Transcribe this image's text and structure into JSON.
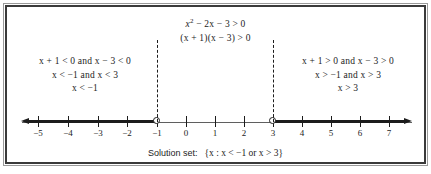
{
  "figure": {
    "kind": "number-line-inequality-diagram",
    "frame_color": "#3a3a3a",
    "ink_color": "#1c1c1c"
  },
  "statement": {
    "line1_parts": {
      "var": "x",
      "exponent": "2",
      "rest": " − 2x − 3 > 0"
    },
    "line1_plain": "x² − 2x − 3 > 0",
    "line2_plain": "(x + 1)(x − 3) > 0"
  },
  "cases": {
    "left": {
      "label": "negative-case",
      "rows": [
        "x + 1 < 0  and  x − 3 < 0",
        "x < −1  and  x < 3",
        "x < −1"
      ]
    },
    "right": {
      "label": "positive-case",
      "rows": [
        "x + 1 > 0  and  x − 3 > 0",
        "x > −1  and  x > 3",
        "x > 3"
      ]
    }
  },
  "number_line": {
    "ticks": [
      {
        "value": -5,
        "label": "−5",
        "x": 38
      },
      {
        "value": -4,
        "label": "−4",
        "x": 68
      },
      {
        "value": -3,
        "label": "−3",
        "x": 98
      },
      {
        "value": -2,
        "label": "−2",
        "x": 127
      },
      {
        "value": -1,
        "label": "−1",
        "x": 157
      },
      {
        "value": 0,
        "label": "0",
        "x": 186
      },
      {
        "value": 1,
        "label": "1",
        "x": 215
      },
      {
        "value": 2,
        "label": "2",
        "x": 244
      },
      {
        "value": 3,
        "label": "3",
        "x": 273
      },
      {
        "value": 4,
        "label": "4",
        "x": 302
      },
      {
        "value": 5,
        "label": "5",
        "x": 331
      },
      {
        "value": 6,
        "label": "6",
        "x": 360
      },
      {
        "value": 7,
        "label": "7",
        "x": 389
      }
    ],
    "critical_points": [
      {
        "value": -1,
        "x": 157,
        "endpoint": "open"
      },
      {
        "value": 3,
        "x": 273,
        "endpoint": "open"
      }
    ],
    "shaded_rays": [
      {
        "name": "left-ray",
        "from_x": 26,
        "to_x": 157,
        "direction": "left",
        "describes": "x < -1"
      },
      {
        "name": "right-ray",
        "from_x": 273,
        "to_x": 406,
        "direction": "right",
        "describes": "x > 3"
      }
    ],
    "dashed_guides": [
      {
        "value": -1,
        "x": 157
      },
      {
        "value": 3,
        "x": 273
      }
    ]
  },
  "solution": {
    "label": "Solution set:",
    "set_notation": "{x : x < −1   or   x > 3}",
    "set_parts": {
      "open_brace": "{",
      "var": "x",
      "colon": ":",
      "first": "x < −1",
      "or": "or",
      "second": "x > 3",
      "close_brace": "}"
    }
  }
}
